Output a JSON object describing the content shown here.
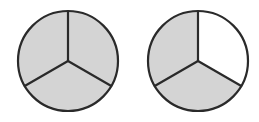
{
  "figure": {
    "background_color": "#FFFFFF",
    "canvas": {
      "width": 259,
      "height": 122
    },
    "stroke_color": "#2A2A2A",
    "shaded_color": "#D4D4D4",
    "unshaded_color": "#FFFFFF",
    "outline_width": 2.2,
    "divider_width": 2.2,
    "divider_angles_degrees": [
      90,
      210,
      330
    ],
    "sectors_per_circle": 3,
    "circles": [
      {
        "id": "circle-left",
        "name": "left-circle",
        "center_x": 68,
        "center_y": 61,
        "radius": 50,
        "shaded_count": 3,
        "total_count": 3,
        "fraction_label": "3/3",
        "sectors": [
          {
            "id": "left-sector-top-left",
            "name": "top-left-sector",
            "start_angle": 90,
            "end_angle": 210,
            "shaded": true
          },
          {
            "id": "left-sector-bottom",
            "name": "bottom-sector",
            "start_angle": 210,
            "end_angle": 330,
            "shaded": true
          },
          {
            "id": "left-sector-top-right",
            "name": "top-right-sector",
            "start_angle": 330,
            "end_angle": 450,
            "shaded": true
          }
        ]
      },
      {
        "id": "circle-right",
        "name": "right-circle",
        "center_x": 198,
        "center_y": 61,
        "radius": 50,
        "shaded_count": 2,
        "total_count": 3,
        "fraction_label": "2/3",
        "sectors": [
          {
            "id": "right-sector-top-left",
            "name": "top-left-sector",
            "start_angle": 90,
            "end_angle": 210,
            "shaded": true
          },
          {
            "id": "right-sector-bottom",
            "name": "bottom-sector",
            "start_angle": 210,
            "end_angle": 330,
            "shaded": true
          },
          {
            "id": "right-sector-top-right",
            "name": "top-right-sector",
            "start_angle": 330,
            "end_angle": 450,
            "shaded": false
          }
        ]
      }
    ]
  }
}
